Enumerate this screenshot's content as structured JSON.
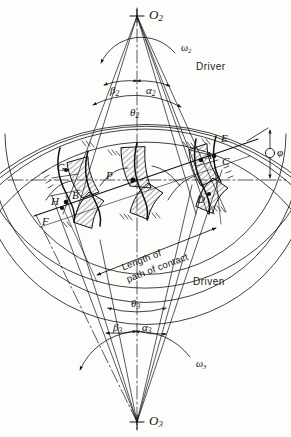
{
  "figure": {
    "type": "engineering-line-diagram",
    "background_color": "#fdfdfc",
    "line_color": "#111111",
    "width": 291,
    "height": 437
  },
  "origins": {
    "upper": {
      "label": "O",
      "subscript": "2",
      "x": 137,
      "y": 16,
      "marker": "plus-cross"
    },
    "lower": {
      "label": "O",
      "subscript": "3",
      "x": 137,
      "y": 422,
      "marker": "plus-cross"
    }
  },
  "gears": {
    "driver": {
      "name_label": "Driver",
      "name_x": 196,
      "name_y": 68,
      "center_x": 137,
      "center_y": 16,
      "angular_velocity": {
        "symbol": "ω",
        "subscript": "2",
        "x": 181,
        "y": 49
      },
      "angles": [
        {
          "symbol": "β",
          "subscript": "2",
          "x": 114,
          "y": 88
        },
        {
          "symbol": "α",
          "subscript": "2",
          "x": 147,
          "y": 88
        },
        {
          "symbol": "θ",
          "subscript": "2",
          "x": 131,
          "y": 113
        }
      ],
      "circles": [
        {
          "name": "addendum",
          "radius": 134
        },
        {
          "name": "pitch",
          "radius": 158
        },
        {
          "name": "base",
          "radius": 149
        },
        {
          "name": "dedendum",
          "radius": 177
        }
      ]
    },
    "driven": {
      "name_label": "Driven",
      "name_x": 193,
      "name_y": 283,
      "center_x": 137,
      "center_y": 422,
      "angular_velocity": {
        "symbol": "ω",
        "subscript": "3",
        "x": 196,
        "y": 365
      },
      "angles": [
        {
          "symbol": "θ",
          "subscript": "3",
          "x": 133,
          "y": 303
        },
        {
          "symbol": "β",
          "subscript": "3",
          "x": 117,
          "y": 328
        },
        {
          "symbol": "α",
          "subscript": "3",
          "x": 144,
          "y": 328
        }
      ],
      "circles": [
        {
          "name": "addendum",
          "radius": 212
        },
        {
          "name": "pitch",
          "radius": 235
        },
        {
          "name": "base",
          "radius": 225
        },
        {
          "name": "dedendum",
          "radius": 253
        }
      ]
    }
  },
  "pressure_angle": {
    "symbol": "φ",
    "x": 270,
    "y": 155,
    "description": "pressure angle marker at right of line of action"
  },
  "contact_points": [
    {
      "label": "A",
      "x": 206,
      "y": 157
    },
    {
      "label": "B",
      "x": 72,
      "y": 196
    },
    {
      "label": "C",
      "x": 224,
      "y": 163
    },
    {
      "label": "D",
      "x": 199,
      "y": 200
    },
    {
      "label": "E",
      "x": 223,
      "y": 140
    },
    {
      "label": "F",
      "x": 44,
      "y": 221
    },
    {
      "label": "G",
      "x": 60,
      "y": 169
    },
    {
      "label": "H",
      "x": 54,
      "y": 202
    },
    {
      "label": "P",
      "x": 110,
      "y": 177
    }
  ],
  "annotations": {
    "path_of_contact": {
      "line1": "Length of",
      "line2": "path of contact",
      "x": 121,
      "y": 259,
      "rotation_deg": -21
    }
  },
  "line_of_action": {
    "from": {
      "x": 38,
      "y": 214
    },
    "to": {
      "x": 253,
      "y": 141
    },
    "description": "pressure line through pitch point P"
  },
  "pitch_line": {
    "y": 180,
    "description": "horizontal common tangent through pitch point"
  }
}
